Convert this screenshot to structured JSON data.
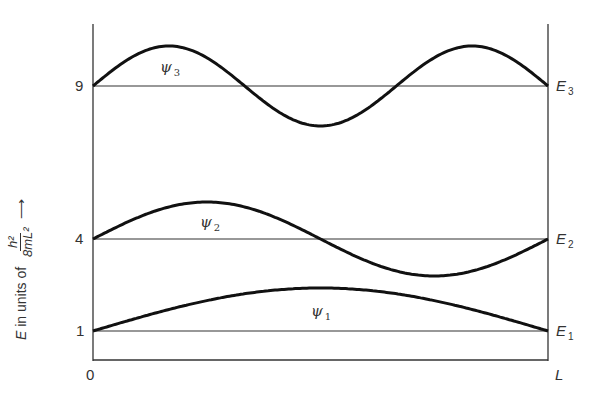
{
  "chart_data": {
    "type": "line",
    "title": "",
    "xlabel": "",
    "ylabel": "E in units of h^2/8mL^2",
    "x_ticks": [
      "0",
      "L"
    ],
    "y_ticks": [
      "1",
      "4",
      "9"
    ],
    "energy_levels": [
      {
        "name": "E1",
        "value": 1
      },
      {
        "name": "E2",
        "value": 4
      },
      {
        "name": "E3",
        "value": 9
      }
    ],
    "series": [
      {
        "name": "ψ1",
        "level": 1,
        "half_wavelengths": 1
      },
      {
        "name": "ψ2",
        "level": 4,
        "half_wavelengths": 2
      },
      {
        "name": "ψ3",
        "level": 9,
        "half_wavelengths": 3
      }
    ],
    "grid": false
  },
  "axis": {
    "origin_label": "0",
    "end_label": "L",
    "y_ticks": {
      "one": "1",
      "four": "4",
      "nine": "9"
    }
  },
  "ylabel": {
    "prefix_E": "E",
    "prefix_rest": " in units of ",
    "frac_num": "h²",
    "frac_den": "8mL²",
    "arrow": "⟶"
  },
  "levels": {
    "e1": {
      "letter": "E",
      "sub": "1"
    },
    "e2": {
      "letter": "E",
      "sub": "2"
    },
    "e3": {
      "letter": "E",
      "sub": "3"
    }
  },
  "waves": {
    "psi1": {
      "letter": "ψ",
      "sub": "1"
    },
    "psi2": {
      "letter": "ψ",
      "sub": "2"
    },
    "psi3": {
      "letter": "ψ",
      "sub": "3"
    }
  },
  "colors": {
    "ink": "#1a1a1a",
    "line": "#333333"
  }
}
